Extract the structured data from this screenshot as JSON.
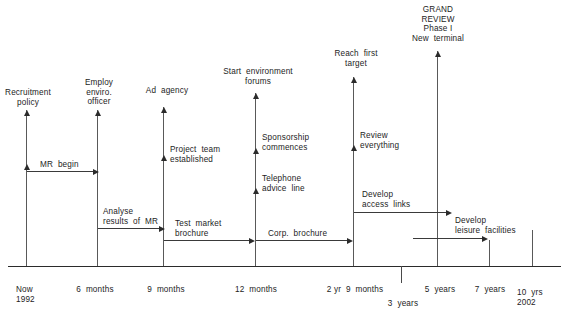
{
  "diagram": {
    "type": "timeline",
    "axis": {
      "ticks": [
        {
          "label_line1": "Now",
          "label_line2": "1992",
          "x": 26
        },
        {
          "label_line1": "6 months",
          "label_line2": "",
          "x": 98
        },
        {
          "label_line1": "9 months",
          "label_line2": "",
          "x": 167
        },
        {
          "label_line1": "12 months",
          "label_line2": "",
          "x": 255
        },
        {
          "label_line1": "2 yr 9 months",
          "label_line2": "",
          "x": 353
        },
        {
          "label_line1": "3 years",
          "label_line2": "",
          "x": 401
        },
        {
          "label_line1": "5 years",
          "label_line2": "",
          "x": 437
        },
        {
          "label_line1": "7 years",
          "label_line2": "",
          "x": 489
        },
        {
          "label_line1": "10 yrs",
          "label_line2": "2002",
          "x": 532
        }
      ]
    },
    "milestones": [
      {
        "id": "recruitment-policy",
        "label": "Recruitment\npolicy",
        "x": 27
      },
      {
        "id": "employ-enviro-officer",
        "label": "Employ\nenviro.\nofficer",
        "x": 97
      },
      {
        "id": "ad-agency",
        "label": "Ad  agency",
        "x": 163
      },
      {
        "id": "start-environment-forums",
        "label": "Start  environment\nforums",
        "x": 255
      },
      {
        "id": "reach-first-target",
        "label": "Reach  first\ntarget",
        "x": 353
      },
      {
        "id": "grand-review",
        "label": "GRAND\nREVIEW\nPhase I\nNew terminal",
        "x": 437
      }
    ],
    "sub_milestones": [
      {
        "id": "project-team-established",
        "label": "Project  team\nestablished",
        "x": 163
      },
      {
        "id": "sponsorship-commences",
        "label": "Sponsorship\ncommences",
        "x": 255
      },
      {
        "id": "telephone-advice-line",
        "label": "Telephone\nadvice  line",
        "x": 255
      },
      {
        "id": "review-everything",
        "label": "Review\neverything",
        "x": 353
      }
    ],
    "activities": [
      {
        "id": "mr-begin",
        "label": "MR  begin"
      },
      {
        "id": "analyse-results-of-mr",
        "label": "Analyse\nresults  of  MR"
      },
      {
        "id": "test-market-brochure",
        "label": "Test  market\nbrochure"
      },
      {
        "id": "corp-brochure",
        "label": "Corp.  brochure"
      },
      {
        "id": "develop-access-links",
        "label": "Develop\naccess  links"
      },
      {
        "id": "develop-leisure-facilities",
        "label": "Develop\nleisure  facilities"
      }
    ],
    "labels": {
      "recruitment_policy_l1": "Recruitment",
      "recruitment_policy_l2": "policy",
      "employ_l1": "Employ",
      "employ_l2": "enviro.",
      "employ_l3": "officer",
      "ad_agency": "Ad  agency",
      "start_forums_l1": "Start  environment",
      "start_forums_l2": "forums",
      "reach_target_l1": "Reach  first",
      "reach_target_l2": "target",
      "grand_l1": "GRAND",
      "grand_l2": "REVIEW",
      "grand_l3": "Phase I",
      "grand_l4": "New  terminal",
      "project_team_l1": "Project  team",
      "project_team_l2": "established",
      "sponsorship_l1": "Sponsorship",
      "sponsorship_l2": "commences",
      "telephone_l1": "Telephone",
      "telephone_l2": "advice  line",
      "review_l1": "Review",
      "review_l2": "everything",
      "mr_begin": "MR  begin",
      "analyse_l1": "Analyse",
      "analyse_l2": "results  of  MR",
      "test_market_l1": "Test  market",
      "test_market_l2": "brochure",
      "corp_brochure": "Corp.  brochure",
      "access_links_l1": "Develop",
      "access_links_l2": "access  links",
      "leisure_l1": "Develop",
      "leisure_l2": "leisure  facilities",
      "tick_now": "Now",
      "tick_1992": "1992",
      "tick_6m": "6  months",
      "tick_9m": "9  months",
      "tick_12m": "12  months",
      "tick_2y9m": "2 yr  9  months",
      "tick_3y": "3  years",
      "tick_5y": "5  years",
      "tick_7y": "7  years",
      "tick_10y": "10  yrs",
      "tick_2002": "2002"
    },
    "colors": {
      "ink": "#1d1d1d",
      "line": "#595959",
      "arrow": "#2b2b2b",
      "background": "#ffffff"
    }
  }
}
